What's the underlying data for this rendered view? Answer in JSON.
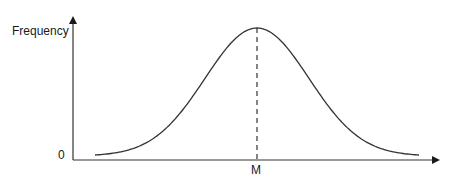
{
  "chart_data": {
    "type": "line",
    "title": "",
    "xlabel": "",
    "ylabel": "Frequency",
    "x_ticks": [
      "M"
    ],
    "y_ticks": [
      "0"
    ],
    "series": [
      {
        "name": "normal distribution",
        "description": "Bell-shaped curve symmetric about the mean M",
        "x": [
          -3,
          -2.5,
          -2,
          -1.5,
          -1,
          -0.5,
          0,
          0.5,
          1,
          1.5,
          2,
          2.5,
          3
        ],
        "values": [
          0.04,
          0.14,
          0.4,
          0.86,
          1.42,
          1.86,
          2.0,
          1.86,
          1.42,
          0.86,
          0.4,
          0.14,
          0.04
        ]
      }
    ],
    "annotations": [
      {
        "type": "dashed-vertical-line",
        "x": "M",
        "label": "M",
        "description": "Dashed line from peak to x-axis at mean M"
      }
    ],
    "grid": false,
    "legend": null
  },
  "labels": {
    "y_axis": "Frequency",
    "origin": "0",
    "mean": "M"
  }
}
